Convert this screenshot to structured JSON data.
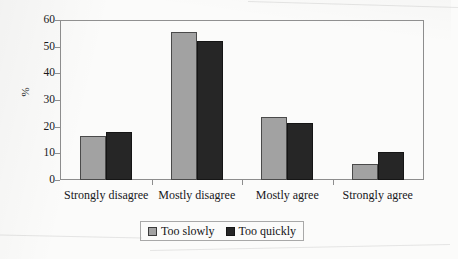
{
  "chart_data": {
    "type": "bar",
    "title": "",
    "subtitle": "",
    "xlabel": "",
    "ylabel": "%",
    "ylim": [
      0,
      60
    ],
    "y_ticks": [
      0,
      10,
      20,
      30,
      40,
      50,
      60
    ],
    "grid": false,
    "legend_position": "bottom",
    "categories": [
      "Strongly disagree",
      "Mostly disagree",
      "Mostly agree",
      "Strongly agree"
    ],
    "series": [
      {
        "name": "Too slowly",
        "color": "#a2a2a2",
        "values": [
          16.5,
          55.5,
          23.5,
          6
        ]
      },
      {
        "name": "Too quickly",
        "color": "#262626",
        "values": [
          18,
          52,
          21.5,
          10.5
        ]
      }
    ]
  },
  "legend": {
    "items": [
      {
        "label": "Too slowly",
        "swatch": "legend-swatch-gray"
      },
      {
        "label": "Too quickly",
        "swatch": "legend-swatch-black"
      }
    ]
  }
}
